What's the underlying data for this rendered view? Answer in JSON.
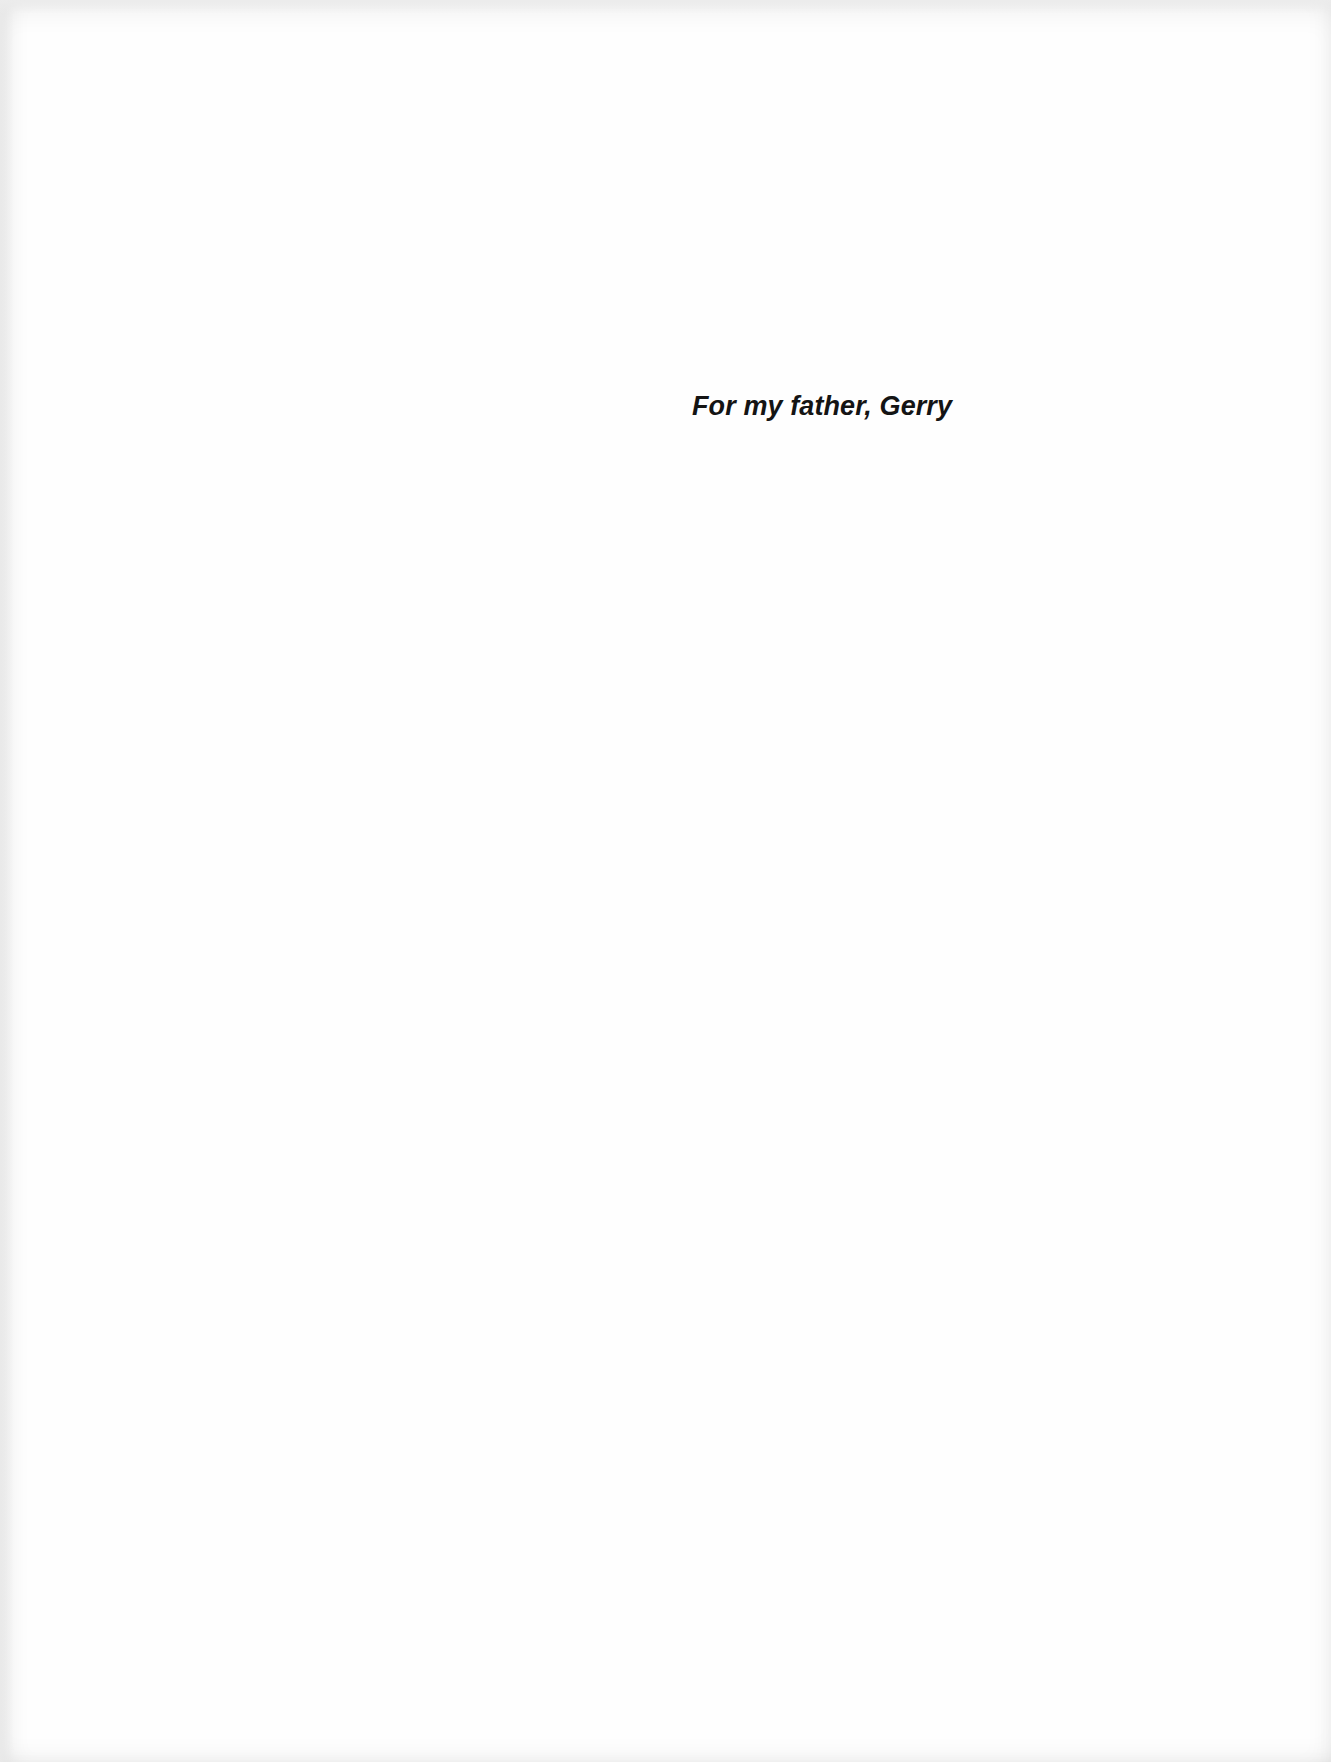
{
  "page": {
    "type": "dedication",
    "dedication_text": "For my father, Gerry"
  },
  "colors": {
    "paper": "#fefefe",
    "text": "#141414",
    "edge_shadow": "#e9e9e9"
  }
}
